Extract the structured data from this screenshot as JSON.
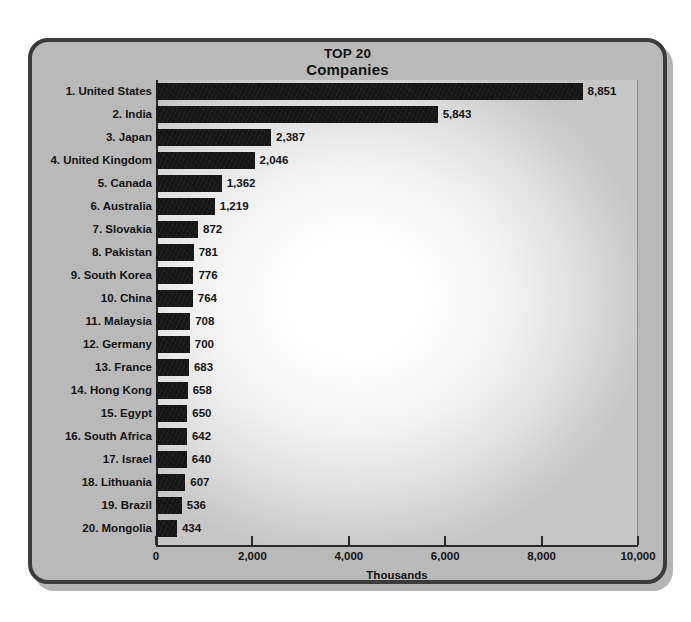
{
  "chart_data": {
    "type": "bar",
    "orientation": "horizontal",
    "title": "TOP 20 Companies",
    "title_line1": "TOP 20",
    "title_line2": "Companies",
    "xlabel": "Thousands",
    "ylabel": "",
    "xlim": [
      0,
      10000
    ],
    "grid": false,
    "legend": null,
    "xticks": [
      "0",
      "2,000",
      "4,000",
      "6,000",
      "8,000",
      "10,000"
    ],
    "xtick_values": [
      0,
      2000,
      4000,
      6000,
      8000,
      10000
    ],
    "categories": [
      "1. United States",
      "2. India",
      "3. Japan",
      "4. United Kingdom",
      "5. Canada",
      "6. Australia",
      "7. Slovakia",
      "8. Pakistan",
      "9. South Korea",
      "10. China",
      "11. Malaysia",
      "12. Germany",
      "13. France",
      "14. Hong Kong",
      "15. Egypt",
      "16. South Africa",
      "17. Israel",
      "18. Lithuania",
      "19. Brazil",
      "20. Mongolia"
    ],
    "values": [
      8851,
      5843,
      2387,
      2046,
      1362,
      1219,
      872,
      781,
      776,
      764,
      708,
      700,
      683,
      658,
      650,
      642,
      640,
      607,
      536,
      434
    ],
    "value_labels": [
      "8,851",
      "5,843",
      "2,387",
      "2,046",
      "1,362",
      "1,219",
      "872",
      "781",
      "776",
      "764",
      "708",
      "700",
      "683",
      "658",
      "650",
      "642",
      "640",
      "607",
      "536",
      "434"
    ],
    "bar_color": "#141414",
    "panel_color": "#b9b9b9",
    "border_color": "#3b3b3b"
  }
}
